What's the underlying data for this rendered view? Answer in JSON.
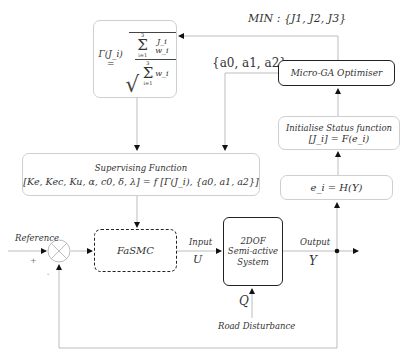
{
  "diagram": {
    "gamma_box": {
      "lhs": "Γ(J_i) =",
      "numerator_sum": "Σ",
      "numerator_upper": "3",
      "numerator_lower": "i=1",
      "numerator_term": "J_i w_i",
      "denominator_sum": "Σ",
      "denominator_upper": "3",
      "denominator_lower": "i=1",
      "denominator_term": "w_i",
      "root": "√"
    },
    "min_label": "MIN : {J1, J2, J3}",
    "coeff_label": "{a0, a1, a2}",
    "optimiser": {
      "label": "Micro-GA Optimiser"
    },
    "init_status": {
      "title": "Initialise Status function",
      "formula": "[J_i] = F(e_i)"
    },
    "error_fn": {
      "formula": "e_i = H(Y)"
    },
    "supervising": {
      "title": "Supervising Function",
      "formula": "[Ke, Kec, Ku, α, c0, δ, λ] = f [Γ(J_i), {a0, a1, a2}]"
    },
    "summing_junction": {
      "plus_sign": "+",
      "minus_sign": "-"
    },
    "reference_label": "Reference",
    "controller": {
      "label": "FaSMC"
    },
    "input_label": "Input",
    "input_symbol": "U",
    "plant": {
      "line1": "2DOF",
      "line2": "Semi-active",
      "line3": "System"
    },
    "output_label": "Output",
    "output_symbol": "Y",
    "disturbance_symbol": "Q",
    "disturbance_label": "Road Disturbance"
  }
}
